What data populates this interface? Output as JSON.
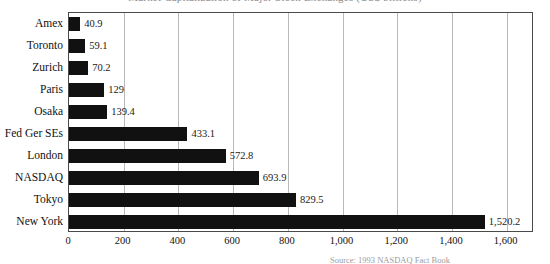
{
  "title": {
    "text": "Market Capitalization of Major Stock Exchanges (US$ billions)",
    "clipped": true
  },
  "source": {
    "text": "Source: 1993 NASDAQ Fact Book",
    "clipped": true
  },
  "chart_data": {
    "type": "bar",
    "orientation": "horizontal",
    "title": "Market Capitalization of Major Stock Exchanges (US$ billions)",
    "xlabel": "",
    "ylabel": "",
    "xlim": [
      0,
      1700
    ],
    "grid": true,
    "legend": "none",
    "categories": [
      "Amex",
      "Toronto",
      "Zurich",
      "Paris",
      "Osaka",
      "Fed Ger SEs",
      "London",
      "NASDAQ",
      "Tokyo",
      "New York"
    ],
    "values": [
      40.9,
      59.1,
      70.2,
      129,
      139.4,
      433.1,
      572.8,
      693.9,
      829.5,
      1520.2
    ],
    "value_labels": [
      "40.9",
      "59.1",
      "70.2",
      "129",
      "139.4",
      "433.1",
      "572.8",
      "693.9",
      "829.5",
      "1,520.2"
    ],
    "xticks": [
      0,
      200,
      400,
      600,
      800,
      1000,
      1200,
      1400,
      1600
    ],
    "xtick_labels": [
      "0",
      "200",
      "400",
      "600",
      "800",
      "1,000",
      "1,200",
      "1,400",
      "1,600"
    ],
    "bar_color": "#111111",
    "grid_color": "#b9b9b9",
    "axis_color": "#4a4a4a"
  }
}
